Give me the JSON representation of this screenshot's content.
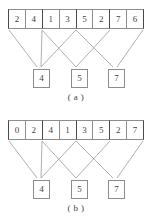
{
  "figures": [
    {
      "id": "figure-a",
      "caption": "( a )",
      "array": {
        "values": [
          "2",
          "4",
          "1",
          "3",
          "5",
          "2",
          "7",
          "6"
        ],
        "group_size": 2,
        "group_boundaries": [
          0,
          2,
          4,
          6
        ]
      },
      "results": [
        {
          "label": "4",
          "x": 33
        },
        {
          "label": "5",
          "x": 71
        },
        {
          "label": "7",
          "x": 108
        }
      ],
      "links": [
        {
          "x1": 9,
          "y1": 30,
          "x2": 37,
          "y2": 67
        },
        {
          "x1": 42,
          "y1": 30,
          "x2": 41,
          "y2": 67
        },
        {
          "x1": 42,
          "y1": 30,
          "x2": 76,
          "y2": 67
        },
        {
          "x1": 76,
          "y1": 30,
          "x2": 41,
          "y2": 67
        },
        {
          "x1": 76,
          "y1": 30,
          "x2": 113,
          "y2": 67
        },
        {
          "x1": 110,
          "y1": 30,
          "x2": 76,
          "y2": 67
        },
        {
          "x1": 143,
          "y1": 30,
          "x2": 117,
          "y2": 67
        }
      ]
    },
    {
      "id": "figure-b",
      "caption": "( b )",
      "array": {
        "values": [
          "0",
          "2",
          "4",
          "1",
          "3",
          "5",
          "2",
          "7"
        ],
        "group_size": 2,
        "group_boundaries": [
          0,
          2,
          4,
          6
        ]
      },
      "results": [
        {
          "label": "4",
          "x": 33
        },
        {
          "label": "5",
          "x": 71
        },
        {
          "label": "7",
          "x": 108
        }
      ],
      "links": [
        {
          "x1": 9,
          "y1": 30,
          "x2": 37,
          "y2": 67
        },
        {
          "x1": 42,
          "y1": 30,
          "x2": 41,
          "y2": 67
        },
        {
          "x1": 42,
          "y1": 30,
          "x2": 76,
          "y2": 67
        },
        {
          "x1": 76,
          "y1": 30,
          "x2": 41,
          "y2": 67
        },
        {
          "x1": 76,
          "y1": 30,
          "x2": 113,
          "y2": 67
        },
        {
          "x1": 110,
          "y1": 30,
          "x2": 76,
          "y2": 67
        },
        {
          "x1": 143,
          "y1": 30,
          "x2": 117,
          "y2": 67
        }
      ]
    }
  ],
  "style": {
    "line_color": "#9a9a9a",
    "cell_border": "#8d8d8d",
    "group_border": "#4a4a4a",
    "text_color": "#3f3f3f",
    "background": "#ffffff"
  }
}
